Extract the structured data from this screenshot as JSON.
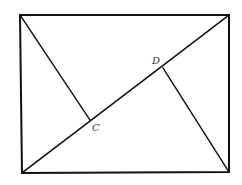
{
  "diagram": {
    "type": "geometry",
    "colors": {
      "line": "#111111",
      "label": "#333333",
      "background": "#ffffff"
    },
    "rectangle": {
      "top_left": [
        20,
        15
      ],
      "top_right": [
        229,
        15
      ],
      "bottom_right": [
        229,
        172
      ],
      "bottom_left": [
        22,
        173
      ]
    },
    "diagonal": {
      "from": [
        22,
        173
      ],
      "to": [
        229,
        15
      ]
    },
    "perpendiculars": [
      {
        "from": [
          20,
          15
        ],
        "to": [
          90,
          120
        ],
        "foot_label": "C"
      },
      {
        "from": [
          229,
          172
        ],
        "to": [
          163,
          68
        ],
        "foot_label": "D"
      }
    ],
    "labels": {
      "C": {
        "text": "C",
        "x": 92,
        "y": 131
      },
      "D": {
        "text": "D",
        "x": 152,
        "y": 64
      }
    }
  }
}
